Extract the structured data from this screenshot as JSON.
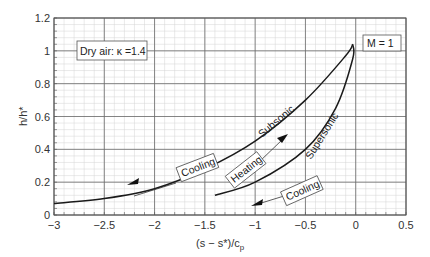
{
  "chart_data": {
    "type": "line",
    "title": "",
    "xlabel": "(s − s*)/c",
    "xlabel_sub": "p",
    "ylabel": "h/h*",
    "xlim": [
      -3,
      0.5
    ],
    "ylim": [
      0,
      1.2
    ],
    "xticks": [
      -3,
      -2.5,
      -2,
      -1.5,
      -1,
      -0.5,
      0,
      0.5
    ],
    "xtick_labels": [
      "−3",
      "−2.5",
      "−2",
      "−1.5",
      "−1",
      "−0.5",
      "0",
      "0.5"
    ],
    "yticks": [
      0,
      0.2,
      0.4,
      0.6,
      0.8,
      1,
      1.2
    ],
    "ytick_labels": [
      "0",
      "0.2",
      "0.4",
      "0.6",
      "0.8",
      "1",
      "1.2"
    ],
    "grid": true,
    "series": [
      {
        "name": "Subsonic",
        "x": [
          -3,
          -2.5,
          -2,
          -1.5,
          -1,
          -0.5,
          -0.1,
          -0.03
        ],
        "y": [
          0.07,
          0.1,
          0.16,
          0.28,
          0.45,
          0.7,
          0.97,
          1.04
        ]
      },
      {
        "name": "Supersonic",
        "x": [
          -1.4,
          -1,
          -0.5,
          -0.2,
          -0.03,
          -0.03
        ],
        "y": [
          0.12,
          0.2,
          0.4,
          0.65,
          0.95,
          1.04
        ]
      }
    ],
    "annotations": [
      {
        "text": "Dry air: κ =1.4",
        "type": "box"
      },
      {
        "text": "M = 1",
        "type": "box"
      },
      {
        "text": "Subsonic",
        "type": "curve-label"
      },
      {
        "text": "Supersonic",
        "type": "curve-label"
      },
      {
        "text": "Cooling",
        "type": "arrow-label",
        "direction": "down-left",
        "branch": "subsonic"
      },
      {
        "text": "Heating",
        "type": "arrow-label",
        "direction": "up-right",
        "branch": "between"
      },
      {
        "text": "Cooling",
        "type": "arrow-label",
        "direction": "down-left",
        "branch": "supersonic"
      }
    ]
  },
  "labels": {
    "kappa_box": "Dry air: κ =1.4",
    "mach_box": "M = 1",
    "subsonic": "Subsonic",
    "supersonic": "Supersonic",
    "cooling_upper": "Cooling",
    "heating": "Heating",
    "cooling_lower": "Cooling",
    "ylabel": "h/h*",
    "xlabel_main": "(s − s*)/c",
    "xlabel_sub": "p"
  },
  "colors": {
    "grid_minor": "#d4d4d4",
    "grid_major": "#6a6a6a",
    "curve": "#1a1a1a",
    "text": "#333333"
  }
}
